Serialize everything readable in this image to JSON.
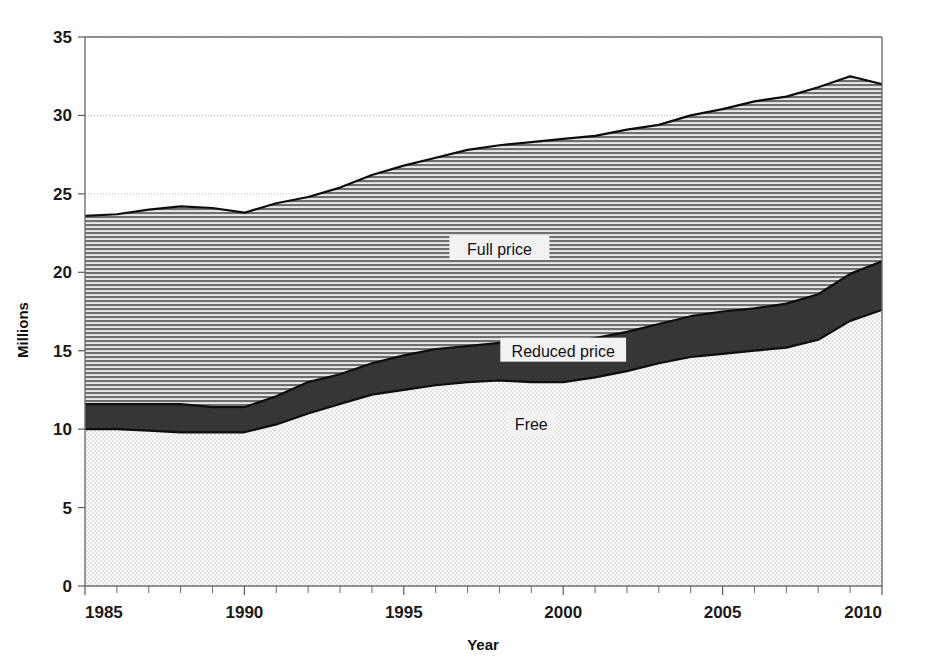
{
  "chart_data": {
    "type": "area",
    "stacked": true,
    "title": "",
    "subtitle": "",
    "xlabel": "Year",
    "ylabel": "Millions",
    "xlim": [
      1985,
      2010
    ],
    "ylim": [
      0,
      35
    ],
    "xticks": [
      1985,
      1990,
      1995,
      2000,
      2005,
      2010
    ],
    "xtick_labels": [
      "1985",
      "1990",
      "1995",
      "2000",
      "2005",
      "2010"
    ],
    "yticks": [
      0,
      5,
      10,
      15,
      20,
      25,
      30,
      35
    ],
    "ytick_labels": [
      "0",
      "5",
      "10",
      "15",
      "20",
      "25",
      "30",
      "35"
    ],
    "minor_xtick_interval": 1,
    "grid": "y-major-dotted",
    "legend_position": "inline-annotations",
    "x": [
      1985,
      1986,
      1987,
      1988,
      1989,
      1990,
      1991,
      1992,
      1993,
      1994,
      1995,
      1996,
      1997,
      1998,
      1999,
      2000,
      2001,
      2002,
      2003,
      2004,
      2005,
      2006,
      2007,
      2008,
      2009,
      2010
    ],
    "series": [
      {
        "name": "Free",
        "pattern": "fine-dot-stipple",
        "color": "#f0f0f0",
        "values": [
          10.0,
          10.0,
          9.9,
          9.8,
          9.8,
          9.8,
          10.3,
          11.0,
          11.6,
          12.2,
          12.5,
          12.8,
          13.0,
          13.1,
          13.0,
          13.0,
          13.3,
          13.7,
          14.2,
          14.6,
          14.8,
          15.0,
          15.2,
          15.7,
          16.9,
          17.6
        ]
      },
      {
        "name": "Reduced price",
        "pattern": "solid-dark",
        "color": "#363636",
        "values": [
          1.6,
          1.6,
          1.7,
          1.8,
          1.6,
          1.6,
          1.8,
          2.0,
          1.9,
          2.0,
          2.2,
          2.3,
          2.3,
          2.4,
          2.4,
          2.5,
          2.5,
          2.5,
          2.5,
          2.6,
          2.7,
          2.7,
          2.8,
          2.9,
          3.0,
          3.1
        ]
      },
      {
        "name": "Full price",
        "pattern": "horizontal-lines",
        "color": "#9a9a9a",
        "values": [
          12.0,
          12.1,
          12.4,
          12.6,
          12.7,
          12.4,
          12.3,
          11.8,
          11.9,
          12.0,
          12.1,
          12.2,
          12.5,
          12.6,
          12.9,
          13.0,
          12.9,
          12.9,
          12.7,
          12.8,
          12.9,
          13.2,
          13.2,
          13.2,
          12.6,
          11.3
        ]
      }
    ],
    "stack_totals": [
      23.6,
      23.7,
      24.0,
      24.2,
      24.1,
      23.8,
      24.4,
      24.8,
      25.4,
      26.2,
      26.8,
      27.3,
      27.8,
      28.1,
      28.3,
      28.5,
      28.7,
      29.1,
      29.4,
      30.0,
      30.4,
      30.9,
      31.2,
      31.8,
      32.5,
      32.0
    ],
    "annotations": [
      {
        "text": "Full price",
        "x": 1998,
        "y": 21.5
      },
      {
        "text": "Reduced price",
        "x": 2000,
        "y": 15.0
      },
      {
        "text": "Free",
        "x": 1999,
        "y": 10.3
      }
    ]
  },
  "axes": {
    "x_title": "Year",
    "y_title": "Millions"
  }
}
